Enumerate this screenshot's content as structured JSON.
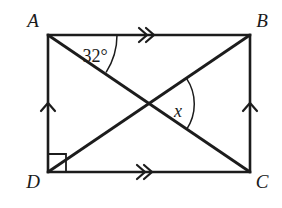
{
  "figure": {
    "type": "geometry-diagram",
    "shape": "rectangle-with-diagonals",
    "background_color": "#ffffff",
    "line_color": "#1c1c1c"
  },
  "vertices": {
    "a": {
      "label": "A",
      "x": 48,
      "y": 35,
      "label_x": 33,
      "label_y": 27
    },
    "b": {
      "label": "B",
      "x": 250,
      "y": 35,
      "label_x": 255,
      "label_y": 27
    },
    "c": {
      "label": "C",
      "x": 250,
      "y": 172,
      "label_x": 255,
      "label_y": 186
    },
    "d": {
      "label": "D",
      "x": 48,
      "y": 172,
      "label_x": 29,
      "label_y": 186
    }
  },
  "angles": {
    "at_a": {
      "label": "32°",
      "value": 32,
      "unit": "degrees",
      "label_x": 95,
      "label_y": 60,
      "vertex": "A",
      "between": [
        "AB",
        "AC"
      ]
    },
    "at_intersection": {
      "label": "x",
      "value": null,
      "label_x": 178,
      "label_y": 114,
      "vertex": "diagonal-intersection",
      "between": [
        "AC",
        "DB"
      ]
    },
    "at_d": {
      "label": "right-angle",
      "value": 90,
      "unit": "degrees",
      "marker": "square"
    }
  },
  "edges": {
    "ab": {
      "name": "AB",
      "tick_marks": 2,
      "tick_style": "double-chevron"
    },
    "dc": {
      "name": "DC",
      "tick_marks": 2,
      "tick_style": "double-chevron"
    },
    "ad": {
      "name": "AD",
      "tick_marks": 1,
      "tick_style": "single-chevron"
    },
    "bc": {
      "name": "BC",
      "tick_marks": 1,
      "tick_style": "single-chevron"
    }
  },
  "diagonals": {
    "ac": {
      "name": "AC",
      "from": "A",
      "to": "C"
    },
    "db": {
      "name": "DB",
      "from": "D",
      "to": "B"
    },
    "intersection": {
      "x": 149,
      "y": 104
    }
  }
}
